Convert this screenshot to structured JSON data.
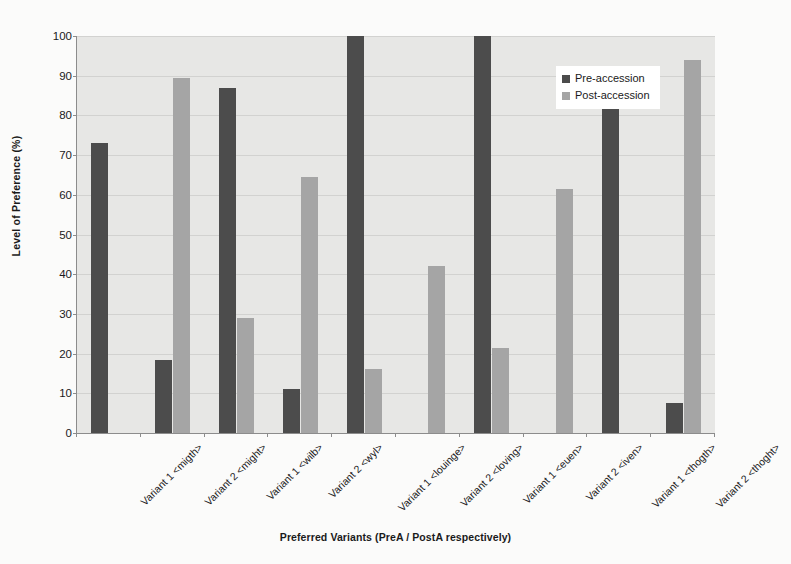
{
  "chart_data": {
    "type": "bar",
    "title": "",
    "xlabel": "Preferred Variants (PreA / PostA respectively)",
    "ylabel": "Level of Preference (%)",
    "ylim": [
      0,
      100
    ],
    "yticks": [
      0,
      10,
      20,
      30,
      40,
      50,
      60,
      70,
      80,
      90,
      100
    ],
    "grid": true,
    "legend_position": "top-right",
    "categories": [
      "Variant 1 <migth>",
      "Variant 2 <might>",
      "Variant 1 <wilb>",
      "Variant 2 <wyl>",
      "Variant 1 <louinge>",
      "Variant 2 <loving>",
      "Variant 1 <euen>",
      "Variant 2 <iven>",
      "Variant 1 <thogth>",
      "Variant 2 <thoght>"
    ],
    "series": [
      {
        "name": "Pre-accession",
        "color": "#4c4c4c",
        "values": [
          73,
          18.5,
          87,
          11,
          100,
          null,
          100,
          null,
          85,
          7.5
        ]
      },
      {
        "name": "Post-accession",
        "color": "#a5a5a5",
        "values": [
          null,
          89.5,
          29,
          64.5,
          16,
          42,
          21.5,
          61.5,
          null,
          94
        ]
      }
    ]
  },
  "legend": {
    "items": [
      {
        "label": "Pre-accession"
      },
      {
        "label": "Post-accession"
      }
    ]
  },
  "colors": {
    "pre_accession": "#4c4c4c",
    "post_accession": "#a5a5a5",
    "plot_background": "#e7e7e5",
    "page_background": "#fbfbfa",
    "gridline": "#d2d2d0",
    "axis": "#8c8c8c"
  }
}
